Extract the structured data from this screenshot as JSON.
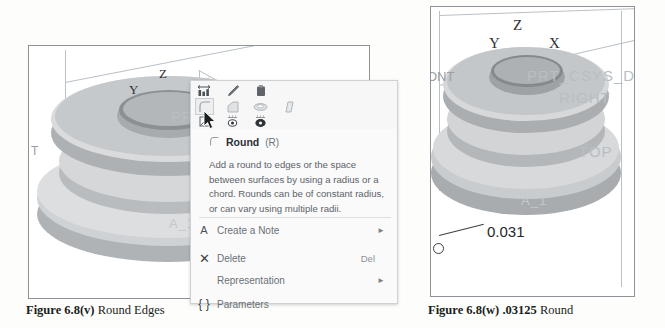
{
  "figures": {
    "left": {
      "caption_bold": "Figure 6.8(v)",
      "caption_rest": "Round Edges",
      "axis_labels": {
        "z": "Z",
        "y": "Y",
        "x": "X"
      },
      "model_labels": [
        "PRT_",
        "A_1"
      ],
      "datum_labels": [
        "T"
      ]
    },
    "right": {
      "caption_bold": "Figure 6.8(w) .03125",
      "caption_rest": "Round",
      "axis_labels": {
        "z": "Z",
        "y": "Y",
        "x": "X"
      },
      "model_labels": [
        "PRT_CSYS_DE",
        "RIGHT",
        "TOP",
        "A_1"
      ],
      "datum_labels": [
        "ONT"
      ],
      "dimension_value": "0.031"
    }
  },
  "context_menu": {
    "toolbar_row1": [
      {
        "name": "dimension-icon",
        "glyph": "dimension"
      },
      {
        "name": "edit-pencil-icon",
        "glyph": "pencil"
      },
      {
        "name": "paste-icon",
        "glyph": "paste"
      }
    ],
    "toolbar_row2": [
      {
        "name": "round-icon",
        "glyph": "round",
        "selected": true
      },
      {
        "name": "chamfer-icon",
        "glyph": "chamfer"
      },
      {
        "name": "shell-icon",
        "glyph": "shell"
      },
      {
        "name": "draft-icon",
        "glyph": "draft"
      }
    ],
    "toolbar_row3": [
      {
        "name": "measure-icon",
        "glyph": "measure"
      },
      {
        "name": "hide-icon",
        "glyph": "eye"
      },
      {
        "name": "show-icon",
        "glyph": "eye2"
      }
    ],
    "tooltip": {
      "title": "Round",
      "shortcut": "(R)",
      "description": "Add a round to edges or the space between surfaces by using a radius or a chord. Rounds can be of constant radius, or can vary using multiple radii."
    },
    "items": [
      {
        "icon": "annotation-icon",
        "icon_glyph": "A",
        "label": "Create a Note",
        "shortcut": "",
        "submenu": true
      },
      {
        "icon": "delete-icon",
        "icon_glyph": "✕",
        "label": "Delete",
        "shortcut": "Del",
        "submenu": false
      },
      {
        "icon": "",
        "icon_glyph": "",
        "label": "Representation",
        "shortcut": "",
        "submenu": true
      },
      {
        "icon": "parameters-icon",
        "icon_glyph": "{ }",
        "label": "Parameters",
        "shortcut": "",
        "submenu": false
      }
    ]
  },
  "colors": {
    "panel_border": "#8e9398",
    "menu_bg": "#fafafa",
    "menu_border": "#cfd2d5",
    "model_light": "#d8dadc",
    "model_mid": "#b8bbbe",
    "model_dark": "#9a9da0",
    "wire": "#b9c0c6",
    "text": "#1a1d20"
  }
}
